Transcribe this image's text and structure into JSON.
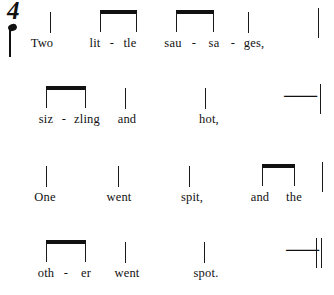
{
  "page": {
    "kind": "rhythm-notation-sheet",
    "background_color": "#ffffff",
    "ink_color": "#111111",
    "title_visible": false
  },
  "time_signature": {
    "numeral": "4",
    "beat_unit_icon": "quarter-note",
    "reading": "4 quarter-note beats per measure"
  },
  "systems": [
    {
      "index": 1,
      "lyrics": [
        {
          "text": "Two",
          "x": 42,
          "type": "word"
        },
        {
          "text": "lit",
          "x": 95,
          "type": "syllable"
        },
        {
          "text": "-",
          "x": 112,
          "type": "hyphen"
        },
        {
          "text": "tle",
          "x": 130,
          "type": "syllable"
        },
        {
          "text": "sau",
          "x": 173,
          "type": "syllable"
        },
        {
          "text": "-",
          "x": 194,
          "type": "hyphen"
        },
        {
          "text": "sa",
          "x": 214,
          "type": "syllable"
        },
        {
          "text": "-",
          "x": 233,
          "type": "hyphen"
        },
        {
          "text": "ges,",
          "x": 254,
          "type": "syllable"
        }
      ],
      "notes": [
        {
          "symbol": "quarter-stem",
          "x": 50,
          "syllable": "Two"
        },
        {
          "symbol": "beamed-pair",
          "x": 100,
          "x2": 137,
          "syllables": "lit-tle"
        },
        {
          "symbol": "beamed-pair",
          "x": 176,
          "x2": 214,
          "syllables": "sau-sa"
        },
        {
          "symbol": "quarter-stem",
          "x": 248,
          "syllable": "ges,"
        }
      ],
      "barline": {
        "type": "single",
        "x": 318
      }
    },
    {
      "index": 2,
      "lyrics": [
        {
          "text": "siz",
          "x": 46,
          "type": "syllable"
        },
        {
          "text": "-",
          "x": 64,
          "type": "hyphen"
        },
        {
          "text": "zling",
          "x": 87,
          "type": "syllable"
        },
        {
          "text": "and",
          "x": 127,
          "type": "word"
        },
        {
          "text": "hot,",
          "x": 209,
          "type": "word"
        }
      ],
      "notes": [
        {
          "symbol": "beamed-pair",
          "x": 46,
          "x2": 86,
          "syllables": "siz-zling"
        },
        {
          "symbol": "quarter-stem",
          "x": 125,
          "syllable": "and"
        },
        {
          "symbol": "quarter-stem",
          "x": 205,
          "syllable": "hot,"
        },
        {
          "symbol": "quarter-rest",
          "x": 283,
          "syllable": ""
        }
      ],
      "barline": {
        "type": "single",
        "x": 320
      }
    },
    {
      "index": 3,
      "lyrics": [
        {
          "text": "One",
          "x": 45,
          "type": "word"
        },
        {
          "text": "went",
          "x": 119,
          "type": "word"
        },
        {
          "text": "spit,",
          "x": 192,
          "type": "word"
        },
        {
          "text": "and",
          "x": 260,
          "type": "word"
        },
        {
          "text": "the",
          "x": 294,
          "type": "word"
        }
      ],
      "notes": [
        {
          "symbol": "quarter-stem",
          "x": 46,
          "syllable": "One"
        },
        {
          "symbol": "quarter-stem",
          "x": 118,
          "syllable": "went"
        },
        {
          "symbol": "quarter-stem",
          "x": 189,
          "syllable": "spit,"
        },
        {
          "symbol": "beamed-pair",
          "x": 262,
          "x2": 295,
          "syllables": "and the"
        }
      ],
      "barline": {
        "type": "single",
        "x": 322
      }
    },
    {
      "index": 4,
      "lyrics": [
        {
          "text": "oth",
          "x": 46,
          "type": "syllable"
        },
        {
          "text": "-",
          "x": 66,
          "type": "hyphen"
        },
        {
          "text": "er",
          "x": 86,
          "type": "syllable"
        },
        {
          "text": "went",
          "x": 127,
          "type": "word"
        },
        {
          "text": "spot.",
          "x": 206,
          "type": "word"
        }
      ],
      "notes": [
        {
          "symbol": "beamed-pair",
          "x": 46,
          "x2": 86,
          "syllables": "oth-er"
        },
        {
          "symbol": "quarter-stem",
          "x": 125,
          "syllable": "went"
        },
        {
          "symbol": "quarter-stem",
          "x": 204,
          "syllable": "spot."
        },
        {
          "symbol": "quarter-rest",
          "x": 285,
          "syllable": ""
        }
      ],
      "barline": {
        "type": "double",
        "x": 316
      }
    }
  ],
  "full_text": "Two little sausages, sizzling and hot, One went spit, and the other went spot.",
  "glyphs": {
    "quarter_rest": "⸺"
  }
}
